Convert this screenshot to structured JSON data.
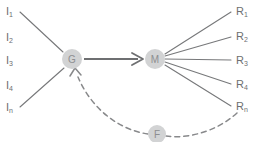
{
  "diagram": {
    "type": "block-flow-feedback",
    "nodes": [
      {
        "id": "G",
        "label": "G",
        "cx": 72,
        "cy": 59,
        "r": 10
      },
      {
        "id": "M",
        "label": "M",
        "cx": 155,
        "cy": 59,
        "r": 10
      },
      {
        "id": "F",
        "label": "F",
        "cx": 157,
        "cy": 134,
        "r": 9
      }
    ],
    "inputs": [
      {
        "base": "I",
        "sub": "1",
        "x": 6,
        "y": 11
      },
      {
        "base": "I",
        "sub": "2",
        "x": 6,
        "y": 37
      },
      {
        "base": "I",
        "sub": "3",
        "x": 6,
        "y": 60
      },
      {
        "base": "I",
        "sub": "4",
        "x": 6,
        "y": 85
      },
      {
        "base": "I",
        "sub": "n",
        "x": 6,
        "y": 107
      }
    ],
    "outputs": [
      {
        "base": "R",
        "sub": "1",
        "x": 236,
        "y": 11
      },
      {
        "base": "R",
        "sub": "2",
        "x": 236,
        "y": 36
      },
      {
        "base": "R",
        "sub": "3",
        "x": 236,
        "y": 60
      },
      {
        "base": "R",
        "sub": "4",
        "x": 236,
        "y": 84
      },
      {
        "base": "R",
        "sub": "n",
        "x": 236,
        "y": 106
      }
    ],
    "colors": {
      "node_fill": "#d2d3d4",
      "node_text": "#8d8e90",
      "edge": "#77787a",
      "edge_main": "#6e6f71",
      "edge_dashed": "#88898b",
      "label_text": "#6d6e70",
      "background": "#ffffff"
    }
  }
}
